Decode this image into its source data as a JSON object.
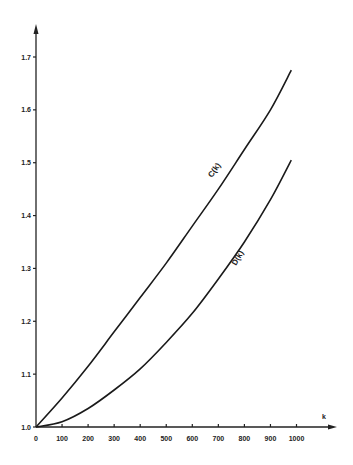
{
  "chart_data": {
    "type": "line",
    "title": "",
    "xlabel": "k",
    "ylabel": "",
    "xlim": [
      0,
      1000
    ],
    "ylim": [
      1.0,
      1.75
    ],
    "grid": false,
    "x_ticks": [
      "0",
      "100",
      "200",
      "300",
      "400",
      "500",
      "600",
      "700",
      "800",
      "900",
      "1000"
    ],
    "y_ticks": [
      "1.0",
      "1.1",
      "1.2",
      "1.3",
      "1.4",
      "1.5",
      "1.6",
      "1.7"
    ],
    "x": [
      0,
      100,
      200,
      300,
      400,
      500,
      600,
      700,
      800,
      900,
      980
    ],
    "series": [
      {
        "name": "C(k)",
        "values": [
          1.0,
          1.055,
          1.115,
          1.18,
          1.245,
          1.31,
          1.38,
          1.45,
          1.525,
          1.6,
          1.675
        ]
      },
      {
        "name": "D(k)",
        "values": [
          1.0,
          1.01,
          1.035,
          1.07,
          1.11,
          1.16,
          1.215,
          1.28,
          1.35,
          1.43,
          1.505
        ]
      }
    ],
    "annotations": [
      {
        "text": "C(k)",
        "near_x": 690,
        "near_y": 1.43
      },
      {
        "text": "D(k)",
        "near_x": 790,
        "near_y": 1.29
      }
    ]
  }
}
